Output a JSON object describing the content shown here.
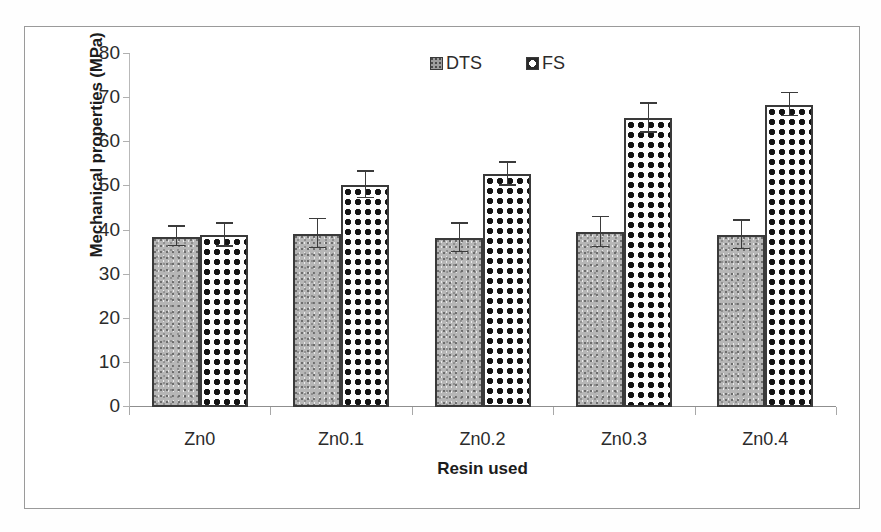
{
  "chart_data": {
    "type": "bar",
    "title": "",
    "xlabel": "Resin used",
    "ylabel": "Mechanical properties (MPa)",
    "categories": [
      "Zn0",
      "Zn0.1",
      "Zn0.2",
      "Zn0.3",
      "Zn0.4"
    ],
    "ylim": [
      0,
      80
    ],
    "ytick_labels": [
      "0",
      "10",
      "20",
      "30",
      "40",
      "50",
      "60",
      "70",
      "80"
    ],
    "ytick_values": [
      0,
      10,
      20,
      30,
      40,
      50,
      60,
      70,
      80
    ],
    "grid": false,
    "legend_position": "top-center",
    "series": [
      {
        "name": "DTS",
        "values": [
          38.6,
          39.3,
          38.3,
          39.6,
          39.0
        ],
        "errors": [
          2.2,
          3.3,
          3.2,
          3.4,
          3.2
        ]
      },
      {
        "name": "FS",
        "values": [
          38.9,
          50.3,
          52.8,
          65.4,
          68.5
        ],
        "errors": [
          2.6,
          3.0,
          2.6,
          3.3,
          2.6
        ]
      }
    ]
  },
  "legend": {
    "entries": [
      {
        "label": "DTS",
        "swatch": "gray-speckled-swatch"
      },
      {
        "label": "FS",
        "swatch": "dark-dotted-swatch"
      }
    ]
  },
  "axes": {
    "y_title": "Mechanical properties (MPa)",
    "x_title": "Resin used"
  }
}
